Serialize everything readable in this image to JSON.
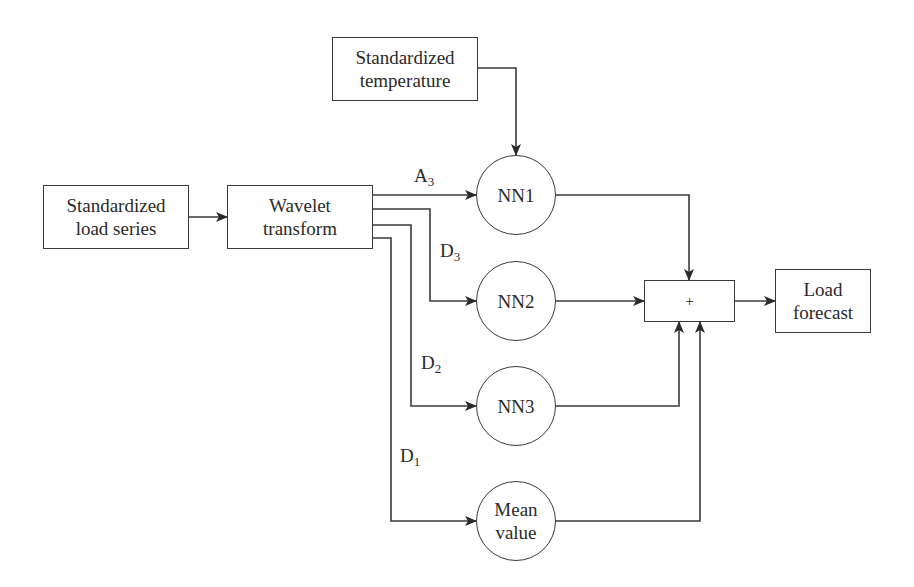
{
  "diagram": {
    "nodes": {
      "load_series": {
        "line1": "Standardized",
        "line2": "load series"
      },
      "temperature": {
        "line1": "Standardized",
        "line2": "temperature"
      },
      "wavelet": {
        "line1": "Wavelet",
        "line2": "transform"
      },
      "nn1": {
        "label": "NN1"
      },
      "nn2": {
        "label": "NN2"
      },
      "nn3": {
        "label": "NN3"
      },
      "mean": {
        "line1": "Mean",
        "line2": "value"
      },
      "sum": {
        "label": "+"
      },
      "forecast": {
        "line1": "Load",
        "line2": "forecast"
      }
    },
    "edge_labels": {
      "a3": {
        "base": "A",
        "sub": "3"
      },
      "d3": {
        "base": "D",
        "sub": "3"
      },
      "d2": {
        "base": "D",
        "sub": "2"
      },
      "d1": {
        "base": "D",
        "sub": "1"
      }
    },
    "edges": [
      {
        "from": "load_series",
        "to": "wavelet"
      },
      {
        "from": "temperature",
        "to": "nn1"
      },
      {
        "from": "wavelet",
        "to": "nn1",
        "label": "A3"
      },
      {
        "from": "wavelet",
        "to": "nn2",
        "label": "D3"
      },
      {
        "from": "wavelet",
        "to": "nn3",
        "label": "D2"
      },
      {
        "from": "wavelet",
        "to": "mean",
        "label": "D1"
      },
      {
        "from": "nn1",
        "to": "sum"
      },
      {
        "from": "nn2",
        "to": "sum"
      },
      {
        "from": "nn3",
        "to": "sum"
      },
      {
        "from": "mean",
        "to": "sum"
      },
      {
        "from": "sum",
        "to": "forecast"
      }
    ]
  }
}
